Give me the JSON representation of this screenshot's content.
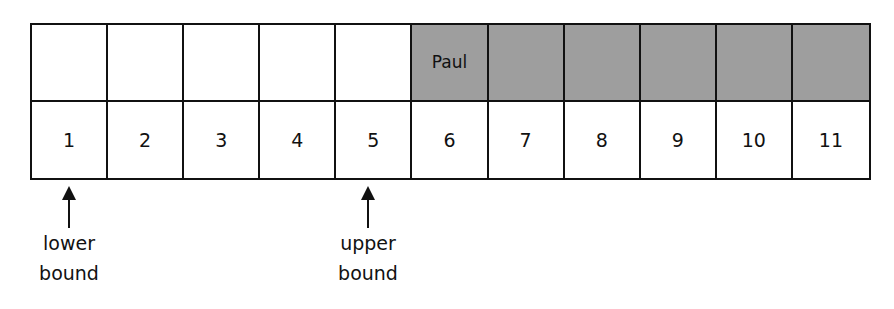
{
  "diagram": {
    "type": "array-binary-search-bounds",
    "top_row": [
      {
        "text": "",
        "shaded": false
      },
      {
        "text": "",
        "shaded": false
      },
      {
        "text": "",
        "shaded": false
      },
      {
        "text": "",
        "shaded": false
      },
      {
        "text": "",
        "shaded": false
      },
      {
        "text": "Paul",
        "shaded": true
      },
      {
        "text": "",
        "shaded": true
      },
      {
        "text": "",
        "shaded": true
      },
      {
        "text": "",
        "shaded": true
      },
      {
        "text": "",
        "shaded": true
      },
      {
        "text": "",
        "shaded": true
      }
    ],
    "indices": [
      "1",
      "2",
      "3",
      "4",
      "5",
      "6",
      "7",
      "8",
      "9",
      "10",
      "11"
    ],
    "pointers": {
      "lower": {
        "line1": "lower",
        "line2": "bound",
        "index": 1
      },
      "upper": {
        "line1": "upper",
        "line2": "bound",
        "index": 5
      }
    },
    "colors": {
      "shaded": "#9e9e9e",
      "border": "#111111",
      "background": "#ffffff"
    }
  }
}
